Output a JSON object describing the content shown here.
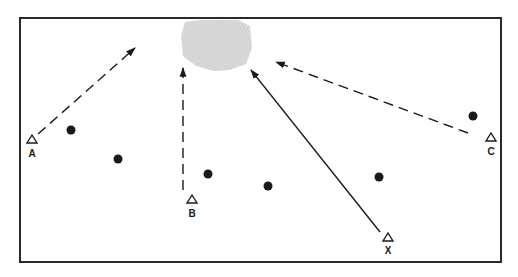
{
  "diagram": {
    "type": "position-diagram",
    "frame": {
      "x": 20,
      "y": 18,
      "width": 481,
      "height": 244,
      "stroke": "#2a2a2a"
    },
    "target_zone": {
      "name": "shaded-target-area",
      "fill": "#d6d6d6",
      "points": "185,22 200,20 238,20 250,26 252,48 246,64 230,70 214,71 196,66 183,56 181,36"
    },
    "markers": [
      {
        "id": "A",
        "label": "A",
        "x": 32,
        "y": 140,
        "label_y": 157
      },
      {
        "id": "B",
        "label": "B",
        "x": 192,
        "y": 200,
        "label_y": 217
      },
      {
        "id": "C",
        "label": "C",
        "x": 491,
        "y": 138,
        "label_y": 155
      },
      {
        "id": "X",
        "label": "X",
        "x": 388,
        "y": 238,
        "label_y": 254
      }
    ],
    "arrows": [
      {
        "from": "A",
        "style": "dashed",
        "x1": 38,
        "y1": 134,
        "x2": 135,
        "y2": 48
      },
      {
        "from": "B",
        "style": "dashed",
        "x1": 183,
        "y1": 190,
        "x2": 183,
        "y2": 68
      },
      {
        "from": "C",
        "style": "dashed",
        "x1": 468,
        "y1": 133,
        "x2": 276,
        "y2": 62
      },
      {
        "from": "X",
        "style": "solid",
        "x1": 380,
        "y1": 232,
        "x2": 251,
        "y2": 70
      }
    ],
    "dots": [
      {
        "x": 71,
        "y": 130
      },
      {
        "x": 118,
        "y": 159
      },
      {
        "x": 208,
        "y": 174
      },
      {
        "x": 268,
        "y": 186
      },
      {
        "x": 379,
        "y": 177
      },
      {
        "x": 473,
        "y": 116
      }
    ],
    "colors": {
      "ink": "#1a1a1a",
      "shade": "#d6d6d6"
    }
  }
}
